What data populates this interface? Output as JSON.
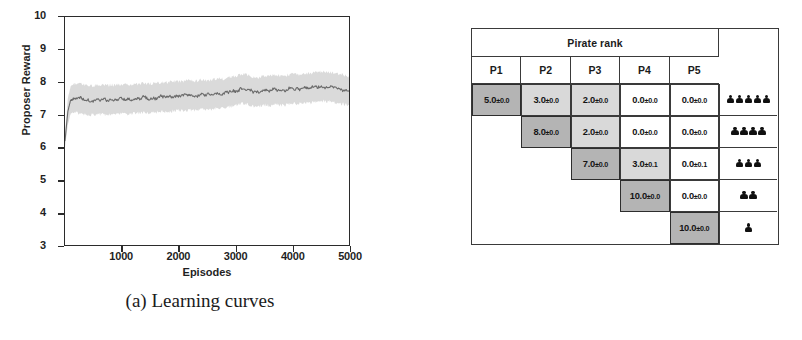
{
  "figure": {
    "panel_a": {
      "caption": "(a) Learning curves",
      "chart_data": {
        "type": "line",
        "title": "",
        "xlabel": "Episodes",
        "ylabel": "Proposer Reward",
        "xlim": [
          0,
          5000
        ],
        "ylim": [
          3,
          10
        ],
        "xticks": [
          1000,
          2000,
          3000,
          4000,
          5000
        ],
        "yticks": [
          3,
          4,
          5,
          6,
          7,
          8,
          9,
          10
        ],
        "grid": false,
        "legend": "none",
        "band": {
          "label": "std deviation shading",
          "color": "#d0d0d0"
        },
        "line_color": "#6f6f6f",
        "series": [
          {
            "name": "Proposer Reward",
            "x": [
              0,
              50,
              100,
              150,
              200,
              300,
              400,
              500,
              600,
              700,
              800,
              900,
              1000,
              1100,
              1200,
              1300,
              1400,
              1500,
              1600,
              1700,
              1800,
              1900,
              2000,
              2100,
              2200,
              2300,
              2400,
              2500,
              2600,
              2700,
              2800,
              2900,
              3000,
              3100,
              3200,
              3300,
              3400,
              3500,
              3600,
              3700,
              3800,
              3900,
              4000,
              4100,
              4200,
              4300,
              4400,
              4500,
              4600,
              4700,
              4800,
              4900,
              5000
            ],
            "mean": [
              6.2,
              7.1,
              7.45,
              7.5,
              7.52,
              7.48,
              7.45,
              7.44,
              7.46,
              7.45,
              7.47,
              7.46,
              7.48,
              7.47,
              7.49,
              7.5,
              7.52,
              7.5,
              7.53,
              7.55,
              7.54,
              7.56,
              7.58,
              7.57,
              7.6,
              7.58,
              7.62,
              7.6,
              7.63,
              7.66,
              7.64,
              7.7,
              7.72,
              7.8,
              7.78,
              7.72,
              7.7,
              7.75,
              7.73,
              7.78,
              7.74,
              7.76,
              7.8,
              7.78,
              7.82,
              7.8,
              7.85,
              7.88,
              7.86,
              7.84,
              7.8,
              7.78,
              7.72
            ],
            "lower": [
              6.0,
              6.7,
              7.05,
              7.1,
              7.12,
              7.08,
              7.05,
              7.04,
              7.06,
              7.05,
              7.07,
              7.06,
              7.08,
              7.07,
              7.09,
              7.1,
              7.12,
              7.1,
              7.13,
              7.15,
              7.14,
              7.16,
              7.18,
              7.17,
              7.2,
              7.18,
              7.22,
              7.2,
              7.23,
              7.26,
              7.24,
              7.3,
              7.32,
              7.4,
              7.38,
              7.32,
              7.3,
              7.35,
              7.33,
              7.38,
              7.34,
              7.36,
              7.4,
              7.38,
              7.42,
              7.4,
              7.45,
              7.48,
              7.46,
              7.44,
              7.4,
              7.38,
              7.32
            ],
            "upper": [
              6.4,
              7.5,
              7.85,
              7.9,
              7.92,
              7.88,
              7.85,
              7.84,
              7.86,
              7.85,
              7.87,
              7.86,
              7.88,
              7.87,
              7.89,
              7.9,
              7.92,
              7.9,
              7.93,
              7.95,
              7.94,
              7.96,
              7.98,
              7.97,
              8.0,
              7.98,
              8.02,
              8.0,
              8.03,
              8.06,
              8.04,
              8.1,
              8.12,
              8.2,
              8.18,
              8.12,
              8.1,
              8.15,
              8.13,
              8.18,
              8.14,
              8.16,
              8.2,
              8.18,
              8.22,
              8.2,
              8.25,
              8.28,
              8.26,
              8.24,
              8.2,
              8.18,
              8.12
            ]
          }
        ]
      }
    },
    "panel_b": {
      "caption": "(b) Learned distribution",
      "table": {
        "group_header": "Pirate rank",
        "columns": [
          "P1",
          "P2",
          "P3",
          "P4",
          "P5"
        ],
        "rows": [
          {
            "cells": [
              {
                "value": "5.0",
                "pm": "±0.0",
                "shade": "dark"
              },
              {
                "value": "3.0",
                "pm": "±0.0",
                "shade": "mid"
              },
              {
                "value": "2.0",
                "pm": "±0.0",
                "shade": "mid"
              },
              {
                "value": "0.0",
                "pm": "±0.0",
                "shade": "none"
              },
              {
                "value": "0.0",
                "pm": "±0.0",
                "shade": "none"
              }
            ],
            "pirates": 5
          },
          {
            "cells": [
              null,
              {
                "value": "8.0",
                "pm": "±0.0",
                "shade": "dark"
              },
              {
                "value": "2.0",
                "pm": "±0.0",
                "shade": "mid"
              },
              {
                "value": "0.0",
                "pm": "±0.0",
                "shade": "none"
              },
              {
                "value": "0.0",
                "pm": "±0.0",
                "shade": "none"
              }
            ],
            "pirates": 4
          },
          {
            "cells": [
              null,
              null,
              {
                "value": "7.0",
                "pm": "±0.0",
                "shade": "dark"
              },
              {
                "value": "3.0",
                "pm": "±0.1",
                "shade": "mid"
              },
              {
                "value": "0.0",
                "pm": "±0.1",
                "shade": "none"
              }
            ],
            "pirates": 3
          },
          {
            "cells": [
              null,
              null,
              null,
              {
                "value": "10.0",
                "pm": "±0.0",
                "shade": "dark"
              },
              {
                "value": "0.0",
                "pm": "±0.0",
                "shade": "none"
              }
            ],
            "pirates": 2
          },
          {
            "cells": [
              null,
              null,
              null,
              null,
              {
                "value": "10.0",
                "pm": "±0.0",
                "shade": "dark"
              }
            ],
            "pirates": 1
          }
        ]
      }
    }
  },
  "colors": {
    "shade_dark": "#b4b4b4",
    "shade_mid": "#d9d9d9",
    "border": "#3a3a3a",
    "line": "#6f6f6f",
    "band": "#d0d0d0"
  }
}
